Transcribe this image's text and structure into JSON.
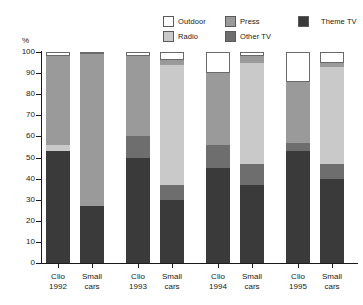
{
  "chart_data": {
    "type": "bar",
    "stacked": true,
    "title": "",
    "subtitle": "",
    "xlabel": "",
    "ylabel": "%",
    "ylim": [
      0,
      100
    ],
    "ytick_labels": [
      "0",
      "10",
      "20",
      "30",
      "40",
      "50",
      "60",
      "70",
      "80",
      "90",
      "100"
    ],
    "ytick_values": [
      0,
      10,
      20,
      30,
      40,
      50,
      60,
      70,
      80,
      90,
      100
    ],
    "grid": false,
    "legend_position": "top-right",
    "categories": [
      "Clio 1992",
      "Small cars",
      "Clio 1993",
      "Small cars",
      "Clio 1994",
      "Small cars",
      "Clio 1995",
      "Small cars"
    ],
    "category_lines": [
      [
        "Clio",
        "1992"
      ],
      [
        "Small",
        "cars"
      ],
      [
        "Clio",
        "1993"
      ],
      [
        "Small",
        "cars"
      ],
      [
        "Clio",
        "1994"
      ],
      [
        "Small",
        "cars"
      ],
      [
        "Clio",
        "1995"
      ],
      [
        "Small",
        "cars"
      ]
    ],
    "group_pairs": [
      {
        "group": "1992",
        "bars": [
          "Clio 1992",
          "Small cars"
        ]
      },
      {
        "group": "1993",
        "bars": [
          "Clio 1993",
          "Small cars"
        ]
      },
      {
        "group": "1994",
        "bars": [
          "Clio 1994",
          "Small cars"
        ]
      },
      {
        "group": "1995",
        "bars": [
          "Clio 1995",
          "Small cars"
        ]
      }
    ],
    "stack_order_bottom_to_top": [
      "Theme TV",
      "Other TV",
      "Radio",
      "Press",
      "Outdoor"
    ],
    "series": [
      {
        "name": "Theme TV",
        "color": "#3a3a3a",
        "values": [
          53,
          27,
          50,
          30,
          45,
          37,
          53,
          40
        ]
      },
      {
        "name": "Other TV",
        "color": "#6e6e6e",
        "values": [
          0,
          0,
          10,
          7,
          11,
          10,
          4,
          7
        ]
      },
      {
        "name": "Radio",
        "color": "#c9c9c9",
        "values": [
          3,
          0,
          0,
          57,
          0,
          48,
          0,
          46
        ]
      },
      {
        "name": "Press",
        "color": "#9a9a9a",
        "values": [
          42,
          72,
          38,
          2,
          34,
          3,
          29,
          2
        ]
      },
      {
        "name": "Outdoor",
        "color": "#ffffff",
        "values": [
          2,
          1,
          2,
          4,
          10,
          2,
          14,
          5
        ]
      }
    ]
  },
  "legend": {
    "entries": [
      {
        "label": "Outdoor",
        "color": "#ffffff",
        "icon": "legend-swatch-outdoor"
      },
      {
        "label": "Press",
        "color": "#9a9a9a",
        "icon": "legend-swatch-press"
      },
      {
        "label": "Theme TV",
        "color": "#3a3a3a",
        "icon": "legend-swatch-theme-tv"
      },
      {
        "label": "Radio",
        "color": "#c9c9c9",
        "icon": "legend-swatch-radio"
      },
      {
        "label": "Other TV",
        "color": "#6e6e6e",
        "icon": "legend-swatch-other-tv"
      }
    ]
  },
  "axis": {
    "y_unit_label": "%"
  }
}
